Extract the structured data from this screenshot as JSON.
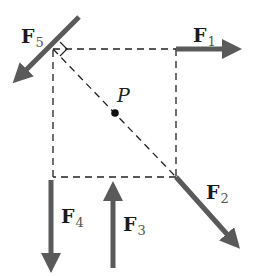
{
  "diagram": {
    "point_label": "P",
    "colors": {
      "arrow": "#5a5a5a",
      "dashed": "#222222",
      "text": "#1a1a1a"
    },
    "square": {
      "top_left": [
        53,
        49
      ],
      "top_right": [
        176,
        49
      ],
      "bottom_right": [
        176,
        177
      ],
      "bottom_left": [
        53,
        177
      ]
    },
    "forces": [
      {
        "id": "F1",
        "symbol": "F",
        "subscript": "1",
        "direction": "right"
      },
      {
        "id": "F2",
        "symbol": "F",
        "subscript": "2",
        "direction": "down-right along diagonal"
      },
      {
        "id": "F3",
        "symbol": "F",
        "subscript": "3",
        "direction": "up"
      },
      {
        "id": "F4",
        "symbol": "F",
        "subscript": "4",
        "direction": "down"
      },
      {
        "id": "F5",
        "symbol": "F",
        "subscript": "5",
        "direction": "down-left, perpendicular to diagonal"
      }
    ]
  }
}
